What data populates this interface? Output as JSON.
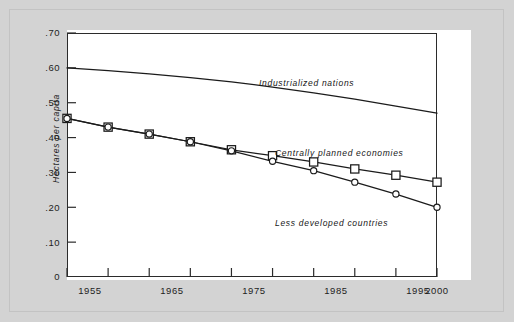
{
  "chart_data": {
    "type": "line",
    "title": "",
    "subtitle": "",
    "xlabel": "",
    "ylabel": "Hectares per capita",
    "xlim": [
      1955,
      2000
    ],
    "ylim": [
      0,
      0.7
    ],
    "grid": false,
    "legend_position": "inline-annotations",
    "x_ticks": [
      1955,
      1960,
      1965,
      1970,
      1975,
      1980,
      1985,
      1990,
      1995,
      2000
    ],
    "x_tick_labels": [
      "1955",
      "",
      "1965",
      "",
      "1975",
      "",
      "1985",
      "",
      "1995",
      "2000"
    ],
    "y_ticks": [
      0,
      0.1,
      0.2,
      0.3,
      0.4,
      0.5,
      0.6,
      0.7
    ],
    "y_tick_labels": [
      "0",
      ".10",
      ".20",
      ".30",
      ".40",
      ".50",
      ".60",
      ".70"
    ],
    "series": [
      {
        "name": "Industrialized nations",
        "marker": "none",
        "color": "#1b1b1b",
        "x": [
          1955,
          1960,
          1965,
          1970,
          1975,
          1980,
          1985,
          1990,
          1995,
          2000
        ],
        "values": [
          0.6,
          0.592,
          0.583,
          0.572,
          0.56,
          0.545,
          0.528,
          0.51,
          0.49,
          0.47
        ]
      },
      {
        "name": "Centrally planned economies",
        "marker": "square",
        "color": "#1b1b1b",
        "x": [
          1955,
          1960,
          1965,
          1970,
          1975,
          1980,
          1985,
          1990,
          1995,
          2000
        ],
        "values": [
          0.455,
          0.43,
          0.41,
          0.388,
          0.365,
          0.348,
          0.33,
          0.31,
          0.292,
          0.272
        ]
      },
      {
        "name": "Less developed countries",
        "marker": "circle",
        "color": "#1b1b1b",
        "x": [
          1955,
          1960,
          1965,
          1970,
          1975,
          1980,
          1985,
          1990,
          1995,
          2000
        ],
        "values": [
          0.455,
          0.43,
          0.41,
          0.388,
          0.362,
          0.332,
          0.305,
          0.272,
          0.238,
          0.2
        ]
      }
    ],
    "annotations": [
      {
        "text": "Industrialized nations",
        "x": 1983,
        "y": 0.545
      },
      {
        "text": "Centrally planned economies",
        "x": 1986,
        "y": 0.355
      },
      {
        "text": "Less developed countries",
        "x": 1986,
        "y": 0.185
      }
    ]
  },
  "labels": {
    "ylabel": "Hectares per capita",
    "industrialized": "Industrialized nations",
    "centrally_planned": "Centrally planned economies",
    "less_developed": "Less developed countries",
    "y0": "0",
    "y10": ".10",
    "y20": ".20",
    "y30": ".30",
    "y40": ".40",
    "y50": ".50",
    "y60": ".60",
    "y70": ".70",
    "x1955": "1955",
    "x1965": "1965",
    "x1975": "1975",
    "x1985": "1985",
    "x1995": "1995",
    "x2000": "2000"
  }
}
